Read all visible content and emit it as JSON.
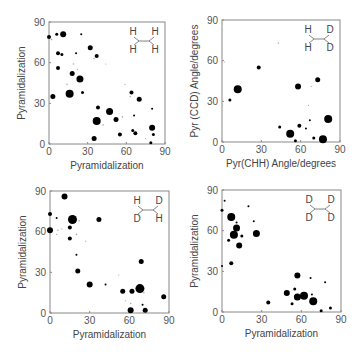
{
  "figure": {
    "panels": [
      {
        "id": "HH-HH",
        "molecule": {
          "tl": "H",
          "tr": "H",
          "bl": "H",
          "br": "H"
        },
        "xlabel": "Pyramidalization",
        "ylabel": "Pyramidalization",
        "frame": {
          "x0": 49,
          "x1": 165,
          "y0": 144,
          "y1": 22
        }
      },
      {
        "id": "HH-DD",
        "molecule": {
          "tl": "H",
          "tr": "D",
          "bl": "H",
          "br": "D"
        },
        "xlabel": "Pyr(CHH) Angle/degrees",
        "ylabel": "Pyr (CCD) Angle/degrees",
        "frame": {
          "x0": 222,
          "x1": 340,
          "y0": 142,
          "y1": 20
        }
      },
      {
        "id": "HD-DH",
        "molecule": {
          "tl": "H",
          "tr": "D",
          "bl": "D",
          "br": "H"
        },
        "xlabel": "Pyramidalization",
        "ylabel": "Pyramidalization",
        "frame": {
          "x0": 50,
          "x1": 169,
          "y0": 313,
          "y1": 191
        }
      },
      {
        "id": "DD-DD",
        "molecule": {
          "tl": "D",
          "tr": "D",
          "bl": "D",
          "br": "D"
        },
        "xlabel": "Pyramidalization",
        "ylabel": "Pyramidalization",
        "frame": {
          "x0": 222,
          "x1": 341,
          "y0": 312,
          "y1": 190
        }
      }
    ],
    "ticks": [
      "0",
      "30",
      "60",
      "90"
    ]
  },
  "chart_data": [
    {
      "type": "scatter",
      "title": "H/H-H/H",
      "xlabel": "Pyramidalization",
      "ylabel": "Pyramidalization",
      "xlim": [
        0,
        90
      ],
      "ylim": [
        0,
        90
      ],
      "xticks": [
        0,
        30,
        60,
        90
      ],
      "yticks": [
        0,
        30,
        60,
        90
      ],
      "points": [
        {
          "x": 0,
          "y": 79,
          "s": 2
        },
        {
          "x": 6,
          "y": 81,
          "s": 1.5
        },
        {
          "x": 11,
          "y": 81,
          "s": 3
        },
        {
          "x": 25,
          "y": 81,
          "s": 1
        },
        {
          "x": 2,
          "y": 77,
          "s": 0.8
        },
        {
          "x": 7,
          "y": 67,
          "s": 2
        },
        {
          "x": 10,
          "y": 66,
          "s": 1.5
        },
        {
          "x": 21,
          "y": 67,
          "s": 1
        },
        {
          "x": 32,
          "y": 71,
          "s": 2.5
        },
        {
          "x": 37,
          "y": 65,
          "s": 2
        },
        {
          "x": 35,
          "y": 63,
          "s": 0.8
        },
        {
          "x": 44,
          "y": 59,
          "s": 0.6
        },
        {
          "x": 7,
          "y": 56,
          "s": 2
        },
        {
          "x": 18,
          "y": 52,
          "s": 2.5
        },
        {
          "x": 19,
          "y": 59,
          "s": 0.8
        },
        {
          "x": 24,
          "y": 48,
          "s": 3.5
        },
        {
          "x": 22,
          "y": 55,
          "s": 0.6
        },
        {
          "x": 14,
          "y": 44,
          "s": 0.8
        },
        {
          "x": 26,
          "y": 38,
          "s": 1.5
        },
        {
          "x": 16,
          "y": 37,
          "s": 4
        },
        {
          "x": 3,
          "y": 35,
          "s": 2.5
        },
        {
          "x": 38,
          "y": 27,
          "s": 2
        },
        {
          "x": 47,
          "y": 24,
          "s": 3.5
        },
        {
          "x": 37,
          "y": 17,
          "s": 4
        },
        {
          "x": 52,
          "y": 18,
          "s": 2.5
        },
        {
          "x": 42,
          "y": 14,
          "s": 0.8
        },
        {
          "x": 35,
          "y": 4,
          "s": 2.5
        },
        {
          "x": 55,
          "y": 7,
          "s": 2
        },
        {
          "x": 57,
          "y": 20,
          "s": 0.8
        },
        {
          "x": 64,
          "y": 38,
          "s": 2
        },
        {
          "x": 63,
          "y": 35,
          "s": 0.8
        },
        {
          "x": 70,
          "y": 33,
          "s": 2.5
        },
        {
          "x": 59,
          "y": 44,
          "s": 0.6
        },
        {
          "x": 66,
          "y": 21,
          "s": 1
        },
        {
          "x": 80,
          "y": 26,
          "s": 1
        },
        {
          "x": 65,
          "y": 10,
          "s": 1.5
        },
        {
          "x": 67,
          "y": 8,
          "s": 2
        },
        {
          "x": 80,
          "y": 12,
          "s": 3
        },
        {
          "x": 81,
          "y": 7,
          "s": 1.5
        },
        {
          "x": 79,
          "y": 1,
          "s": 1.5
        },
        {
          "x": 75,
          "y": 4,
          "s": 0.6
        }
      ]
    },
    {
      "type": "scatter",
      "title": "H/H-D/D",
      "xlabel": "Pyr(CHH) Angle/degrees",
      "ylabel": "Pyr (CCD) Angle/degrees",
      "xlim": [
        0,
        90
      ],
      "ylim": [
        0,
        90
      ],
      "xticks": [
        0,
        30,
        60,
        90
      ],
      "yticks": [
        0,
        30,
        60,
        90
      ],
      "points": [
        {
          "x": 0,
          "y": 83,
          "s": 0.6
        },
        {
          "x": 43,
          "y": 73,
          "s": 0.8
        },
        {
          "x": 2,
          "y": 59,
          "s": 0.6
        },
        {
          "x": 28,
          "y": 55,
          "s": 2
        },
        {
          "x": 12,
          "y": 39,
          "s": 4
        },
        {
          "x": 6,
          "y": 31,
          "s": 1.5
        },
        {
          "x": 58,
          "y": 41,
          "s": 3
        },
        {
          "x": 73,
          "y": 46,
          "s": 2.5
        },
        {
          "x": 68,
          "y": 41,
          "s": 0.6
        },
        {
          "x": 66,
          "y": 27,
          "s": 0.6
        },
        {
          "x": 67,
          "y": 16,
          "s": 1
        },
        {
          "x": 81,
          "y": 17,
          "s": 4
        },
        {
          "x": 44,
          "y": 11,
          "s": 1.5
        },
        {
          "x": 59,
          "y": 12,
          "s": 2
        },
        {
          "x": 64,
          "y": 10,
          "s": 1
        },
        {
          "x": 52,
          "y": 6,
          "s": 4
        },
        {
          "x": 56,
          "y": 1,
          "s": 1.5
        },
        {
          "x": 70,
          "y": 3,
          "s": 1.5
        },
        {
          "x": 77,
          "y": 2,
          "s": 4
        }
      ]
    },
    {
      "type": "scatter",
      "title": "H/D-D/H",
      "xlabel": "Pyramidalization",
      "ylabel": "Pyramidalization",
      "xlim": [
        0,
        90
      ],
      "ylim": [
        0,
        90
      ],
      "xticks": [
        0,
        30,
        60,
        90
      ],
      "yticks": [
        0,
        30,
        60,
        90
      ],
      "points": [
        {
          "x": 11,
          "y": 86,
          "s": 3
        },
        {
          "x": 0,
          "y": 73,
          "s": 2
        },
        {
          "x": 5,
          "y": 70,
          "s": 1
        },
        {
          "x": 17,
          "y": 69,
          "s": 4.5
        },
        {
          "x": 22,
          "y": 68,
          "s": 0.8
        },
        {
          "x": 37,
          "y": 69,
          "s": 2.5
        },
        {
          "x": 15,
          "y": 63,
          "s": 2
        },
        {
          "x": 0,
          "y": 61,
          "s": 3
        },
        {
          "x": 6,
          "y": 61,
          "s": 0.8
        },
        {
          "x": 9,
          "y": 62,
          "s": 0.6
        },
        {
          "x": 5,
          "y": 58,
          "s": 0.6
        },
        {
          "x": 20,
          "y": 58,
          "s": 0.8
        },
        {
          "x": 15,
          "y": 55,
          "s": 2
        },
        {
          "x": 27,
          "y": 53,
          "s": 0.6
        },
        {
          "x": 20,
          "y": 43,
          "s": 1
        },
        {
          "x": 21,
          "y": 31,
          "s": 2.5
        },
        {
          "x": 30,
          "y": 21,
          "s": 3
        },
        {
          "x": 42,
          "y": 21,
          "s": 1
        },
        {
          "x": 52,
          "y": 28,
          "s": 0.6
        },
        {
          "x": 69,
          "y": 38,
          "s": 2.5
        },
        {
          "x": 55,
          "y": 16,
          "s": 2.5
        },
        {
          "x": 62,
          "y": 16,
          "s": 2.5
        },
        {
          "x": 68,
          "y": 18,
          "s": 4.5
        },
        {
          "x": 71,
          "y": 15,
          "s": 0.8
        },
        {
          "x": 57,
          "y": 9,
          "s": 0.6
        },
        {
          "x": 61,
          "y": 7,
          "s": 0.8
        },
        {
          "x": 70,
          "y": 6,
          "s": 1
        },
        {
          "x": 61,
          "y": 2,
          "s": 3
        },
        {
          "x": 72,
          "y": 2,
          "s": 2.5
        },
        {
          "x": 86,
          "y": 12,
          "s": 2.5
        }
      ]
    },
    {
      "type": "scatter",
      "title": "D/D-D/D",
      "xlabel": "Pyramidalization",
      "ylabel": "Pyramidalization",
      "xlim": [
        0,
        90
      ],
      "ylim": [
        0,
        90
      ],
      "xticks": [
        0,
        30,
        60,
        90
      ],
      "yticks": [
        0,
        30,
        60,
        90
      ],
      "points": [
        {
          "x": 2,
          "y": 82,
          "s": 1
        },
        {
          "x": 0,
          "y": 75,
          "s": 1.5
        },
        {
          "x": 20,
          "y": 78,
          "s": 1
        },
        {
          "x": 7,
          "y": 70,
          "s": 4
        },
        {
          "x": 11,
          "y": 66,
          "s": 1
        },
        {
          "x": 24,
          "y": 67,
          "s": 1
        },
        {
          "x": 11,
          "y": 62,
          "s": 3.5
        },
        {
          "x": 9,
          "y": 57,
          "s": 4
        },
        {
          "x": 15,
          "y": 56,
          "s": 1.5
        },
        {
          "x": 5,
          "y": 53,
          "s": 1.5
        },
        {
          "x": 13,
          "y": 49,
          "s": 3
        },
        {
          "x": 26,
          "y": 58,
          "s": 3.5
        },
        {
          "x": 7,
          "y": 36,
          "s": 2
        },
        {
          "x": 0,
          "y": 34,
          "s": 1
        },
        {
          "x": 57,
          "y": 27,
          "s": 3
        },
        {
          "x": 67,
          "y": 25,
          "s": 1
        },
        {
          "x": 78,
          "y": 22,
          "s": 1
        },
        {
          "x": 55,
          "y": 17,
          "s": 1.5
        },
        {
          "x": 49,
          "y": 14,
          "s": 3
        },
        {
          "x": 57,
          "y": 11,
          "s": 3.5
        },
        {
          "x": 62,
          "y": 12,
          "s": 4
        },
        {
          "x": 68,
          "y": 13,
          "s": 1
        },
        {
          "x": 69,
          "y": 8,
          "s": 4
        },
        {
          "x": 53,
          "y": 6,
          "s": 1.5
        },
        {
          "x": 35,
          "y": 7,
          "s": 2
        },
        {
          "x": 75,
          "y": 1,
          "s": 1.5
        },
        {
          "x": 82,
          "y": 3,
          "s": 1.5
        }
      ]
    }
  ]
}
